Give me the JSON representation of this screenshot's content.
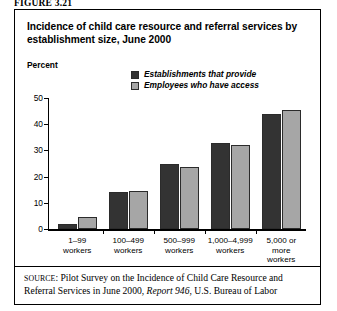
{
  "figure": {
    "label": "FIGURE 3.21"
  },
  "chart_title": "Incidence of child care resource and referral services by establishment size, June 2000",
  "axis": {
    "y_label": "Percent",
    "y_ticks": [
      "50",
      "40",
      "30",
      "20",
      "10",
      "0"
    ]
  },
  "legend": {
    "items": [
      {
        "label": "Establishments that provide",
        "color": "#333333",
        "swatch": "dark"
      },
      {
        "label": "Employees who have access",
        "color": "#a6a6a6",
        "swatch": "light"
      }
    ]
  },
  "source": {
    "prefix": "SOURCE",
    "text_1": ": Pilot Survey on the Incidence of Child Care Resource and Referral Services in June 2000, ",
    "italic": "Report 946",
    "text_2": ", U.S. Bureau of Labor"
  },
  "chart_data": {
    "type": "bar",
    "title": "Incidence of child care resource and referral services by establishment size, June 2000",
    "xlabel": "",
    "ylabel": "Percent",
    "ylim": [
      0,
      50
    ],
    "yticks": [
      0,
      10,
      20,
      30,
      40,
      50
    ],
    "grid": false,
    "legend_position": "top-right-inside",
    "categories": [
      "1–99\nworkers",
      "100–499\nworkers",
      "500–999\nworkers",
      "1,000–4,999\nworkers",
      "5,000 or\nmore\nworkers"
    ],
    "series": [
      {
        "name": "Establishments that provide",
        "color": "#333333",
        "values": [
          2,
          14,
          25,
          33,
          44
        ]
      },
      {
        "name": "Employees who have access",
        "color": "#a6a6a6",
        "values": [
          4.5,
          14.5,
          23.5,
          32,
          45.5
        ]
      }
    ]
  }
}
